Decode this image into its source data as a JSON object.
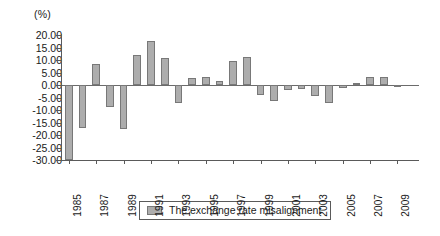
{
  "chart_data": {
    "type": "bar",
    "title": "",
    "subtitle": "",
    "unit_label": "(%)",
    "xlabel": "",
    "ylabel": "",
    "ylim": [
      -30.0,
      20.0
    ],
    "ytick_step": 5.0,
    "yticks": [
      "20.00",
      "15.00",
      "10.00",
      "5.00",
      "0.00",
      "-5.00",
      "-10.00",
      "-15.00",
      "-20.00",
      "-25.00",
      "-30.00"
    ],
    "ytick_values": [
      20.0,
      15.0,
      10.0,
      5.0,
      0.0,
      -5.0,
      -10.0,
      -15.0,
      -20.0,
      -25.0,
      -30.0
    ],
    "grid": false,
    "legend_position": "bottom-center",
    "legend": [
      "The exchange rate misalignment"
    ],
    "xtick_labels": [
      "1985",
      "1987",
      "1989",
      "1991",
      "1993",
      "1995",
      "1997",
      "1999",
      "2001",
      "2003",
      "2005",
      "2007",
      "2009"
    ],
    "categories": [
      "1985",
      "1986",
      "1987",
      "1988",
      "1989",
      "1990",
      "1991",
      "1992",
      "1993",
      "1994",
      "1995",
      "1996",
      "1997",
      "1998",
      "1999",
      "2000",
      "2001",
      "2002",
      "2003",
      "2004",
      "2005",
      "2006",
      "2007",
      "2008",
      "2009",
      "2010"
    ],
    "series": [
      {
        "name": "The exchange rate misalignment",
        "color": "#adadad",
        "values": [
          -31.0,
          -17.2,
          8.3,
          -8.7,
          -17.5,
          12.2,
          17.5,
          10.9,
          -7.0,
          2.9,
          3.2,
          1.5,
          9.7,
          11.2,
          -3.8,
          -6.5,
          -1.9,
          -1.5,
          -4.2,
          -7.3,
          -1.0,
          0.7,
          3.2,
          3.3,
          -0.6,
          0.0
        ]
      }
    ]
  },
  "legend": {
    "label": "The exchange rate misalignment"
  }
}
